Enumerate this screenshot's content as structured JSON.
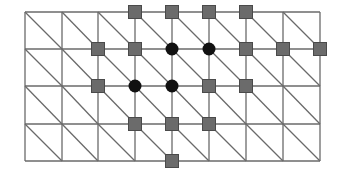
{
  "diagram": {
    "type": "triangulated-grid-stencil",
    "grid": {
      "cols": 8,
      "rows": 4,
      "x_lines": [
        25,
        62,
        98,
        135,
        172,
        209,
        246,
        283,
        320
      ],
      "y_lines": [
        12,
        49,
        86,
        124,
        161
      ],
      "diagonal_direction": "top-left-to-bottom-right",
      "line_color": "#6a6a6a"
    },
    "colors": {
      "square": "#6b6b6b",
      "square_border": "#4a4a4a",
      "circle": "#111111"
    },
    "nodes": [
      {
        "type": "square",
        "col": 3,
        "row": 0
      },
      {
        "type": "square",
        "col": 4,
        "row": 0
      },
      {
        "type": "square",
        "col": 5,
        "row": 0
      },
      {
        "type": "square",
        "col": 6,
        "row": 0
      },
      {
        "type": "square",
        "col": 2,
        "row": 1
      },
      {
        "type": "square",
        "col": 3,
        "row": 1
      },
      {
        "type": "circle",
        "col": 4,
        "row": 1
      },
      {
        "type": "circle",
        "col": 5,
        "row": 1
      },
      {
        "type": "square",
        "col": 6,
        "row": 1
      },
      {
        "type": "square",
        "col": 7,
        "row": 1
      },
      {
        "type": "square",
        "col": 8,
        "row": 1
      },
      {
        "type": "square",
        "col": 2,
        "row": 2
      },
      {
        "type": "circle",
        "col": 3,
        "row": 2
      },
      {
        "type": "circle",
        "col": 4,
        "row": 2
      },
      {
        "type": "square",
        "col": 5,
        "row": 2
      },
      {
        "type": "square",
        "col": 6,
        "row": 2
      },
      {
        "type": "square",
        "col": 3,
        "row": 3
      },
      {
        "type": "square",
        "col": 4,
        "row": 3
      },
      {
        "type": "square",
        "col": 5,
        "row": 3
      },
      {
        "type": "square",
        "col": 4,
        "row": 4
      }
    ]
  }
}
